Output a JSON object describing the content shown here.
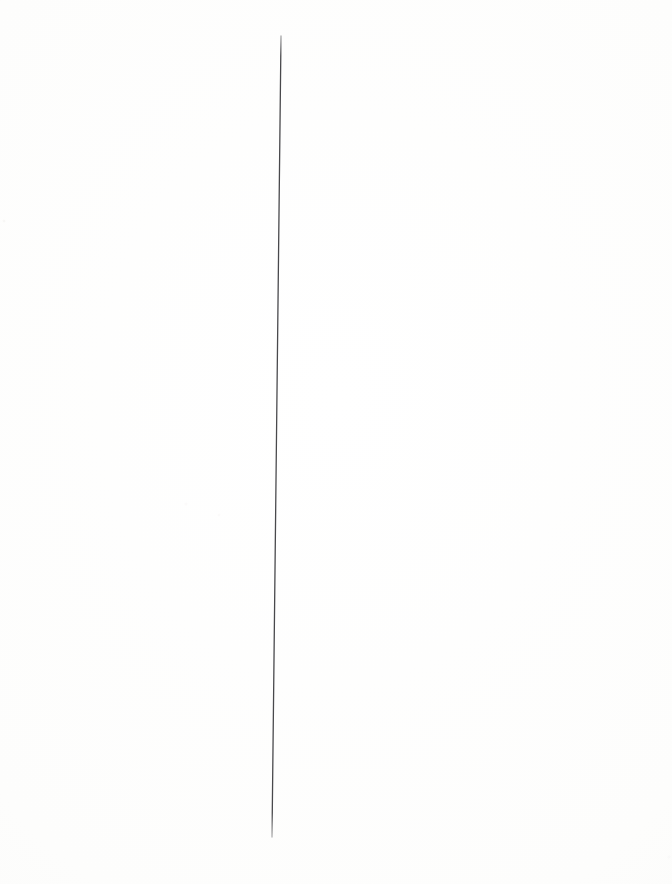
{
  "page": {
    "kind": "scanned-blank-page",
    "width": 672,
    "height": 884,
    "background_color": "#fdfdfd",
    "paper_edge_color": "#f7f7f6",
    "text_content": "",
    "caption": ""
  },
  "ink": {
    "marks": [
      {
        "name": "vertical-ink-line",
        "shape": "line",
        "description": "single long hand-drawn near-vertical line, leaning slightly left toward the bottom",
        "x1": 281,
        "y1": 36,
        "x2": 272,
        "y2": 837,
        "stroke_color": "#2e2e32",
        "stroke_width": 1.3,
        "opacity": 0.92
      }
    ]
  },
  "annotations": {
    "mark_count": 1,
    "has_text": false
  }
}
